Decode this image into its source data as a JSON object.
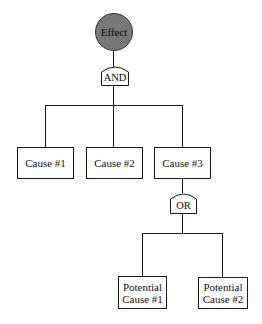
{
  "diagram": {
    "type": "fault-tree",
    "top_event": {
      "label": "Effect",
      "fill": "#777777"
    },
    "gates": [
      {
        "id": "and",
        "label": "AND"
      },
      {
        "id": "or",
        "label": "OR"
      }
    ],
    "causes": [
      {
        "label": "Cause #1"
      },
      {
        "label": "Cause #2"
      },
      {
        "label": "Cause #3"
      }
    ],
    "potential_causes": [
      {
        "line1": "Potential",
        "line2": "Cause #1"
      },
      {
        "line1": "Potential",
        "line2": "Cause #2"
      }
    ]
  }
}
